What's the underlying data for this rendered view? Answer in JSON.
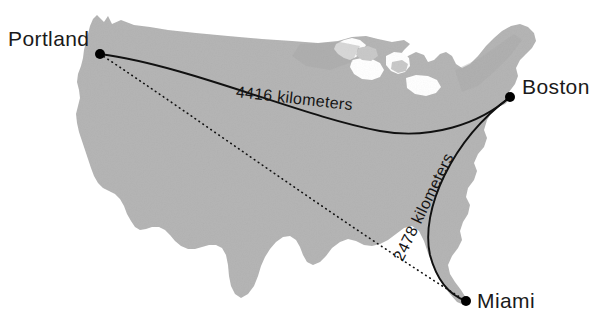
{
  "figure": {
    "kind": "distance-map",
    "region": "contiguous-united-states",
    "background_color": "#ffffff",
    "land_fill_color": "#b5b5b5",
    "land_shadow_color": "#a2a2a2",
    "lake_color": "#c9c9c9",
    "route_color": "#111111",
    "marker_color": "#000000"
  },
  "cities": [
    {
      "id": "portland",
      "name": "Portland",
      "x": 100,
      "y": 54,
      "label_x": 8,
      "label_y": 28
    },
    {
      "id": "boston",
      "name": "Boston",
      "x": 510,
      "y": 97,
      "label_x": 522,
      "label_y": 76
    },
    {
      "id": "miami",
      "name": "Miami",
      "x": 466,
      "y": 301,
      "label_x": 477,
      "label_y": 290
    }
  ],
  "routes": [
    {
      "id": "portland-boston",
      "from": "Portland",
      "to": "Boston",
      "style": "solid",
      "distance_value": 4416,
      "distance_unit": "kilometers",
      "label": "4416 kilometers",
      "label_rotation_deg": 6.5
    },
    {
      "id": "boston-miami",
      "from": "Boston",
      "to": "Miami",
      "style": "solid",
      "distance_value": 2478,
      "distance_unit": "kilometers",
      "label": "2478 kilometers",
      "label_rotation_deg": -64
    },
    {
      "id": "portland-miami",
      "from": "Portland",
      "to": "Miami",
      "style": "dotted",
      "label": ""
    }
  ]
}
